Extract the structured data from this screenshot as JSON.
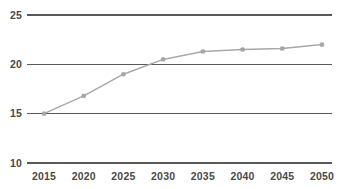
{
  "chart_data": {
    "type": "line",
    "title": "",
    "subtitle": "",
    "xlabel": "",
    "ylabel": "",
    "categories": [
      "2015",
      "2020",
      "2025",
      "2030",
      "2035",
      "2040",
      "2045",
      "2050"
    ],
    "x": [
      2015,
      2020,
      2025,
      2030,
      2035,
      2040,
      2045,
      2050
    ],
    "values": [
      15.0,
      16.8,
      19.0,
      20.5,
      21.3,
      21.5,
      21.6,
      22.0
    ],
    "series": [
      {
        "name": "",
        "values": [
          15.0,
          16.8,
          19.0,
          20.5,
          21.3,
          21.5,
          21.6,
          22.0
        ]
      }
    ],
    "ylim": [
      10,
      25
    ],
    "xlim": [
      2015,
      2050
    ],
    "yticks": [
      10,
      15,
      20,
      25
    ],
    "ytick_labels": [
      "10",
      "15",
      "20",
      "25"
    ],
    "xticks": [
      2015,
      2020,
      2025,
      2030,
      2035,
      2040,
      2045,
      2050
    ],
    "xtick_labels": [
      "2015",
      "2020",
      "2025",
      "2030",
      "2035",
      "2040",
      "2045",
      "2050"
    ],
    "grid": true,
    "grid_axis": "y",
    "legend": false,
    "legend_position": "none",
    "markers": true,
    "annotations": []
  },
  "style": {
    "background": "#ffffff",
    "gridline_color": "#595959",
    "line_color": "#a8a8a8",
    "marker_color": "#a8a8a8",
    "tick_label_color": "#4a4a4a"
  },
  "labels": {
    "y_axis_tick_0": "10",
    "y_axis_tick_1": "15",
    "y_axis_tick_2": "20",
    "y_axis_tick_3": "25",
    "x_axis_tick_0": "2015",
    "x_axis_tick_1": "2020",
    "x_axis_tick_2": "2025",
    "x_axis_tick_3": "2030",
    "x_axis_tick_4": "2035",
    "x_axis_tick_5": "2040",
    "x_axis_tick_6": "2045",
    "x_axis_tick_7": "2050"
  }
}
